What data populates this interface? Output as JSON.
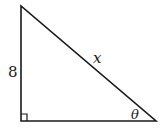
{
  "diagram": {
    "type": "right-triangle",
    "vertical_leg_label": "8",
    "hypotenuse_label": "x",
    "angle_label": "θ",
    "right_angle_marker": true,
    "stroke_color": "#1a1a1a"
  }
}
